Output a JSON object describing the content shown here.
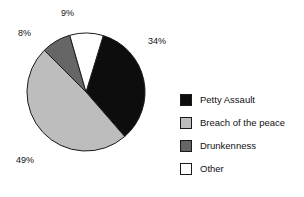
{
  "chart_data": {
    "type": "pie",
    "title": "",
    "categories": [
      "Petty Assault",
      "Breach of the peace",
      "Drunkenness",
      "Other"
    ],
    "values": [
      34,
      49,
      8,
      9
    ],
    "value_labels": [
      "34%",
      "49%",
      "8%",
      "9%"
    ],
    "unit": "%",
    "legend_position": "right",
    "grid": false,
    "colors": [
      "#0d0d0d",
      "#bdbdbd",
      "#666666",
      "#ffffff"
    ],
    "slice_border_color": "#1a1a1a",
    "start_angle_deg": 17,
    "direction": "clockwise",
    "background": "#ffffff",
    "slices": [
      {
        "label": "Petty Assault",
        "value": 34,
        "display": "34%",
        "color": "#0d0d0d",
        "start_deg": 17,
        "end_deg": 139
      },
      {
        "label": "Breach of the peace",
        "value": 49,
        "display": "49%",
        "color": "#bdbdbd",
        "start_deg": 139,
        "end_deg": 315
      },
      {
        "label": "Drunkenness",
        "value": 8,
        "display": "8%",
        "color": "#666666",
        "start_deg": 315,
        "end_deg": 344
      },
      {
        "label": "Other",
        "value": 9,
        "display": "9%",
        "color": "#ffffff",
        "start_deg": 344,
        "end_deg": 377
      }
    ]
  },
  "labels": {
    "petty_assault_pct": "34%",
    "breach_pct": "49%",
    "drunkenness_pct": "8%",
    "other_pct": "9%"
  },
  "legend": {
    "items": [
      {
        "label": "Petty Assault",
        "color": "#0d0d0d"
      },
      {
        "label": "Breach of the peace",
        "color": "#bdbdbd"
      },
      {
        "label": "Drunkenness",
        "color": "#666666"
      },
      {
        "label": "Other",
        "color": "#ffffff"
      }
    ]
  }
}
